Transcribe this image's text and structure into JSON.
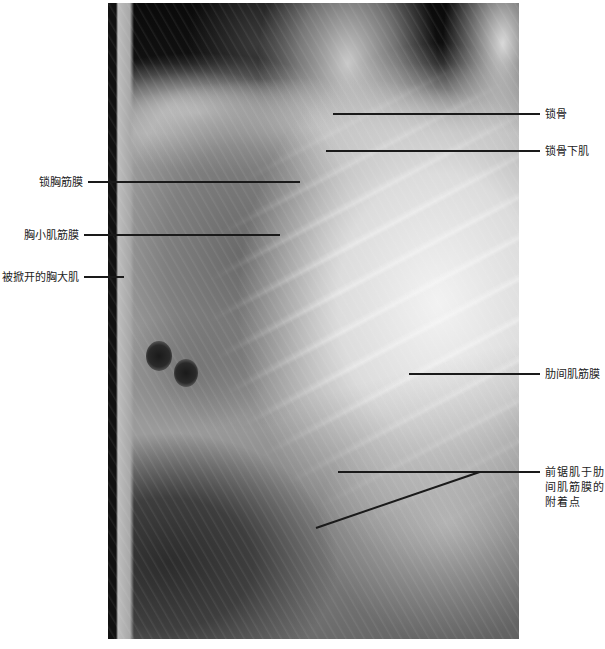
{
  "figure": {
    "photo_description": "Grayscale anatomical dissection photograph of the anterior chest wall showing clavicle and intercostal fascia",
    "labels_left": [
      {
        "text": "锁胸筋膜"
      },
      {
        "text": "胸小肌筋膜"
      },
      {
        "text": "被掀开的胸大肌"
      }
    ],
    "labels_right": [
      {
        "text": "锁骨"
      },
      {
        "text": "锁骨下肌"
      },
      {
        "text": "肋间肌筋膜"
      },
      {
        "text": "前锯肌于肋间肌筋膜的附着点"
      }
    ],
    "colors": {
      "leader_line": "#1a1a1a",
      "label_text": "#222222",
      "background": "#ffffff"
    }
  }
}
